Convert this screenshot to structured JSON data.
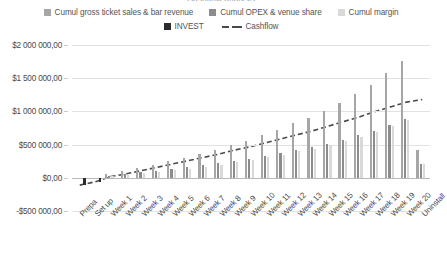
{
  "chart": {
    "title": "Cashflow analysis",
    "legend": {
      "position": "top",
      "rows": [
        [
          {
            "label": "Cumul gross ticket sales & bar revenue",
            "marker": "square",
            "color": "#a6a6a6"
          },
          {
            "label": "Cumul OPEX & venue share",
            "marker": "square",
            "color": "#8c8c8c"
          },
          {
            "label": "Cumul margin",
            "marker": "square",
            "color": "#d9d9d9"
          }
        ],
        [
          {
            "label": "INVEST",
            "marker": "square",
            "color": "#2b2b2b"
          },
          {
            "label": "Cashflow",
            "marker": "dashed-line",
            "color": "#4a4a4a"
          }
        ]
      ]
    },
    "y_axis": {
      "ticks": [
        {
          "value": 2000000,
          "label": "$2 000 000,00"
        },
        {
          "value": 1500000,
          "label": "$1 500 000,00"
        },
        {
          "value": 1000000,
          "label": "$1 000 000,00"
        },
        {
          "value": 500000,
          "label": "$500 000,00"
        },
        {
          "value": 0,
          "label": "$0,00"
        },
        {
          "value": -500000,
          "label": "-$500 000,00"
        }
      ]
    }
  },
  "chart_data": {
    "type": "bar",
    "title": "Cashflow analysis",
    "xlabel": "",
    "ylabel": "",
    "ylim": [
      -500000,
      2000000
    ],
    "grid": true,
    "legend_position": "top",
    "categories": [
      "Prepa",
      "Set up",
      "Week 1",
      "Week 2",
      "Week 3",
      "Week 4",
      "Week 5",
      "Week 6",
      "Week 7",
      "Week 8",
      "Week 9",
      "Week 10",
      "Week 11",
      "Week 12",
      "Week 13",
      "Week 14",
      "Week 15",
      "Week 16",
      "Week 17",
      "Week 18",
      "Week 19",
      "Week 20",
      "Uninstall"
    ],
    "series": [
      {
        "name": "Cumul gross ticket sales & bar revenue",
        "type": "bar",
        "color": "#a6a6a6",
        "values": [
          0,
          0,
          60000,
          95000,
          150000,
          190000,
          250000,
          300000,
          360000,
          420000,
          500000,
          560000,
          640000,
          720000,
          820000,
          900000,
          1000000,
          1120000,
          1260000,
          1400000,
          1580000,
          1760000,
          420000
        ]
      },
      {
        "name": "Cumul OPEX & venue share",
        "type": "bar",
        "color": "#8c8c8c",
        "values": [
          0,
          0,
          30000,
          50000,
          80000,
          100000,
          130000,
          160000,
          190000,
          220000,
          260000,
          290000,
          330000,
          370000,
          420000,
          460000,
          510000,
          570000,
          640000,
          710000,
          800000,
          890000,
          210000
        ]
      },
      {
        "name": "Cumul margin",
        "type": "bar",
        "color": "#d9d9d9",
        "values": [
          0,
          0,
          28000,
          45000,
          70000,
          90000,
          120000,
          140000,
          170000,
          200000,
          240000,
          270000,
          310000,
          350000,
          400000,
          440000,
          490000,
          550000,
          620000,
          690000,
          780000,
          870000,
          210000
        ]
      },
      {
        "name": "INVEST",
        "type": "bar",
        "color": "#2b2b2b",
        "values": [
          -110000,
          -60000,
          0,
          0,
          0,
          0,
          0,
          0,
          0,
          0,
          0,
          0,
          0,
          0,
          0,
          0,
          0,
          0,
          0,
          0,
          0,
          0,
          0
        ]
      },
      {
        "name": "Cashflow",
        "type": "line",
        "style": "dashed",
        "color": "#4a4a4a",
        "values": [
          -110000,
          -60000,
          20000,
          60000,
          110000,
          160000,
          210000,
          260000,
          310000,
          360000,
          420000,
          470000,
          530000,
          590000,
          650000,
          710000,
          780000,
          850000,
          920000,
          1000000,
          1070000,
          1140000,
          1180000
        ]
      }
    ]
  }
}
